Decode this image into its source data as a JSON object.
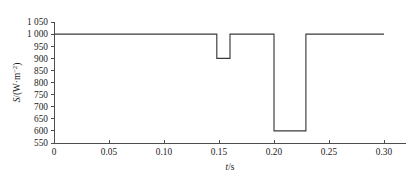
{
  "chart_data": {
    "type": "line",
    "title": "",
    "subtitle": "",
    "xlabel": "t/s",
    "ylabel": "S/(W·m⁻²)",
    "xlim": [
      0,
      0.32
    ],
    "ylim": [
      550,
      1050
    ],
    "grid": false,
    "legend": "none",
    "x_ticks": [
      0,
      0.05,
      0.1,
      0.15,
      0.2,
      0.25,
      0.3
    ],
    "x_tick_labels": [
      "0",
      "0.05",
      "0.10",
      "0.15",
      "0.20",
      "0.25",
      "0.30"
    ],
    "y_ticks": [
      550,
      600,
      650,
      700,
      750,
      800,
      850,
      900,
      950,
      1000,
      1050
    ],
    "y_tick_labels": [
      "550",
      "600",
      "650",
      "700",
      "750",
      "800",
      "850",
      "900",
      "950",
      "1 000",
      "1 050"
    ],
    "series": [
      {
        "name": "S(t)",
        "color": "#3a3a3a",
        "step": true,
        "x": [
          0.0,
          0.148,
          0.148,
          0.16,
          0.16,
          0.2,
          0.2,
          0.229,
          0.229,
          0.3
        ],
        "y": [
          1000,
          1000,
          900,
          900,
          1000,
          1000,
          600,
          600,
          1000,
          1000
        ]
      }
    ],
    "annotations": [
      {
        "label": "baseline",
        "value": 1000
      },
      {
        "label": "first-dip-level",
        "value": 900
      },
      {
        "label": "first-dip-start",
        "value": 0.148
      },
      {
        "label": "first-dip-end",
        "value": 0.16
      },
      {
        "label": "second-dip-level",
        "value": 600
      },
      {
        "label": "second-dip-start",
        "value": 0.2
      },
      {
        "label": "second-dip-end",
        "value": 0.229
      }
    ]
  },
  "axis_labels": {
    "y_symbol": "S",
    "y_unit": "/(W·m",
    "y_exponent": "−2",
    "y_close": ")",
    "x_symbol": "t",
    "x_unit": "/s"
  }
}
